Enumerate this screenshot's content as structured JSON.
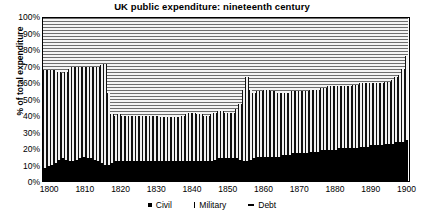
{
  "chart_data": {
    "type": "area",
    "title": "UK public expenditure: nineteenth century",
    "xlabel": "",
    "ylabel": "% of total expenditure",
    "ylim": [
      0,
      100
    ],
    "xlim": [
      1798,
      1901
    ],
    "grid": false,
    "stacked": true,
    "legend_position": "bottom",
    "ytick_labels": [
      "0%",
      "10%",
      "20%",
      "30%",
      "40%",
      "50%",
      "60%",
      "70%",
      "80%",
      "90%",
      "100%"
    ],
    "ytick_values": [
      0,
      10,
      20,
      30,
      40,
      50,
      60,
      70,
      80,
      90,
      100
    ],
    "xtick_labels": [
      "1800",
      "1810",
      "1820",
      "1830",
      "1840",
      "1850",
      "1860",
      "1870",
      "1880",
      "1890",
      "1900"
    ],
    "xtick_values": [
      1800,
      1810,
      1820,
      1830,
      1840,
      1850,
      1860,
      1870,
      1880,
      1890,
      1900
    ],
    "legend": [
      "Civil",
      "Military",
      "Debt"
    ],
    "series_order": [
      "civil",
      "military",
      "debt"
    ],
    "x": [
      1798,
      1799,
      1800,
      1801,
      1802,
      1803,
      1804,
      1805,
      1806,
      1807,
      1808,
      1809,
      1810,
      1811,
      1812,
      1813,
      1814,
      1815,
      1816,
      1817,
      1818,
      1819,
      1820,
      1821,
      1822,
      1823,
      1824,
      1825,
      1826,
      1827,
      1828,
      1829,
      1830,
      1831,
      1832,
      1833,
      1834,
      1835,
      1836,
      1837,
      1838,
      1839,
      1840,
      1841,
      1842,
      1843,
      1844,
      1845,
      1846,
      1847,
      1848,
      1849,
      1850,
      1851,
      1852,
      1853,
      1854,
      1855,
      1856,
      1857,
      1858,
      1859,
      1860,
      1861,
      1862,
      1863,
      1864,
      1865,
      1866,
      1867,
      1868,
      1869,
      1870,
      1871,
      1872,
      1873,
      1874,
      1875,
      1876,
      1877,
      1878,
      1879,
      1880,
      1881,
      1882,
      1883,
      1884,
      1885,
      1886,
      1887,
      1888,
      1889,
      1890,
      1891,
      1892,
      1893,
      1894,
      1895,
      1896,
      1897,
      1898,
      1899,
      1900
    ],
    "series": [
      {
        "name": "Civil",
        "key": "civil",
        "pattern": "solid-black",
        "color": "#000000",
        "values": [
          8,
          9,
          10,
          11,
          13,
          14,
          13,
          12,
          12,
          13,
          14,
          15,
          14,
          14,
          13,
          12,
          11,
          10,
          10,
          11,
          12,
          12,
          12,
          12,
          12,
          12,
          12,
          12,
          12,
          12,
          12,
          12,
          12,
          12,
          12,
          12,
          12,
          12,
          12,
          12,
          12,
          12,
          12,
          12,
          12,
          12,
          12,
          12,
          13,
          14,
          14,
          14,
          14,
          14,
          14,
          13,
          12,
          12,
          13,
          14,
          15,
          15,
          15,
          15,
          15,
          15,
          15,
          16,
          16,
          16,
          17,
          17,
          17,
          17,
          17,
          18,
          18,
          18,
          19,
          19,
          19,
          19,
          19,
          20,
          20,
          20,
          20,
          20,
          20,
          21,
          21,
          21,
          22,
          22,
          22,
          22,
          23,
          23,
          23,
          24,
          24,
          24,
          25
        ]
      },
      {
        "name": "Military",
        "key": "military",
        "pattern": "vertical-lines",
        "color": "#111111",
        "values": [
          60,
          59,
          58,
          57,
          54,
          52,
          54,
          57,
          58,
          57,
          56,
          55,
          56,
          56,
          57,
          58,
          60,
          62,
          44,
          30,
          28,
          29,
          28,
          28,
          28,
          28,
          28,
          28,
          28,
          28,
          28,
          28,
          28,
          27,
          27,
          27,
          27,
          27,
          27,
          28,
          29,
          30,
          30,
          29,
          29,
          28,
          28,
          29,
          29,
          29,
          29,
          28,
          28,
          28,
          30,
          34,
          44,
          52,
          43,
          40,
          40,
          40,
          41,
          41,
          40,
          40,
          39,
          38,
          38,
          38,
          38,
          38,
          38,
          38,
          38,
          38,
          38,
          38,
          38,
          38,
          39,
          39,
          39,
          38,
          38,
          38,
          38,
          39,
          39,
          39,
          39,
          39,
          38,
          38,
          38,
          38,
          38,
          38,
          39,
          40,
          41,
          45,
          52
        ]
      },
      {
        "name": "Debt",
        "key": "debt",
        "pattern": "horizontal-lines",
        "color": "#6e6e6e",
        "values": [
          32,
          32,
          32,
          32,
          33,
          34,
          33,
          31,
          30,
          30,
          30,
          30,
          30,
          30,
          30,
          30,
          29,
          28,
          46,
          59,
          60,
          59,
          60,
          60,
          60,
          60,
          60,
          60,
          60,
          60,
          60,
          60,
          60,
          61,
          61,
          61,
          61,
          61,
          61,
          60,
          59,
          58,
          58,
          59,
          59,
          60,
          60,
          59,
          58,
          57,
          57,
          58,
          58,
          58,
          56,
          53,
          44,
          36,
          44,
          46,
          45,
          45,
          44,
          44,
          45,
          45,
          46,
          46,
          46,
          46,
          45,
          45,
          45,
          45,
          45,
          44,
          44,
          44,
          43,
          43,
          42,
          42,
          42,
          42,
          42,
          42,
          42,
          41,
          41,
          40,
          40,
          40,
          40,
          40,
          40,
          40,
          39,
          39,
          38,
          36,
          35,
          31,
          23
        ]
      }
    ],
    "annotations": [
      {
        "label": "Napoleonic war peak",
        "x": 1815,
        "military_top": 72
      },
      {
        "label": "Post-war debt burden",
        "x": 1820,
        "debt_share": 60
      },
      {
        "label": "Crimean war spike",
        "x": 1855,
        "military_top": 64
      },
      {
        "label": "Boer war spike",
        "x": 1900,
        "military_top": 77
      }
    ]
  },
  "legend": {
    "civil": "Civil",
    "military": "Military",
    "debt": "Debt"
  }
}
